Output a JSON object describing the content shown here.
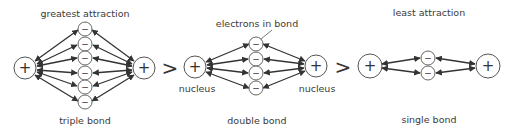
{
  "diagram": {
    "comparators": [
      ">",
      ">"
    ],
    "panels": [
      {
        "id": "triple",
        "top_label": "greatest attraction",
        "bottom_label": "triple bond",
        "nucleus_labels": [],
        "electron_count": 6,
        "nucleus_symbol": "+",
        "electron_symbol": "−"
      },
      {
        "id": "double",
        "top_label": "electrons in bond",
        "bottom_label": "double bond",
        "nucleus_labels": [
          "nucleus",
          "nucleus"
        ],
        "electron_count": 4,
        "nucleus_symbol": "+",
        "electron_symbol": "−"
      },
      {
        "id": "single",
        "top_label": "least attraction",
        "bottom_label": "single bond",
        "nucleus_labels": [],
        "electron_count": 2,
        "nucleus_symbol": "+",
        "electron_symbol": "−"
      }
    ],
    "colors": {
      "stroke": "#333333",
      "circle_stroke": "#555555",
      "text": "#3a3a3a",
      "background": "#ffffff"
    }
  }
}
